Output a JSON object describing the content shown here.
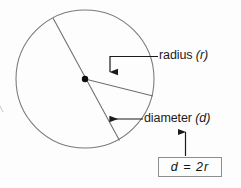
{
  "figure": {
    "background_color": "#fdfdfd",
    "stroke_color": "#6e6e6e",
    "annotation_color": "#1b1b1b",
    "circle": {
      "center_x": 85,
      "center_y": 79,
      "radius": 69,
      "center_dot_radius": 3.2
    },
    "radius_segment": {
      "from": [
        85,
        79
      ],
      "to": [
        153,
        96
      ]
    },
    "diameter_segment": {
      "from": [
        53,
        18
      ],
      "to": [
        119,
        140
      ]
    }
  },
  "labels": {
    "radius": {
      "text": "radius",
      "symbol": "(r)",
      "full": "radius (r)",
      "leader": "elbow-left-then-down-arrow"
    },
    "diameter": {
      "text": "diameter",
      "symbol": "(d)",
      "full": "diameter (d)",
      "leader": "horizontal-left-arrow"
    }
  },
  "formula": {
    "expression": "d  =  2r",
    "left_term": "d",
    "operator": "=",
    "right_term": "2r",
    "border_color": "#8d8d8d",
    "leader": "vertical-up-arrow"
  }
}
